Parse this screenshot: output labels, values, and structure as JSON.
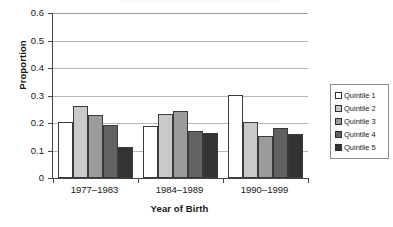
{
  "chart_data": {
    "type": "bar",
    "title": "",
    "xlabel": "Year of Birth",
    "ylabel": "Proportion",
    "categories": [
      "1977–1983",
      "1984–1989",
      "1990–1999"
    ],
    "series": [
      {
        "name": "Quintile 1",
        "color": "#ffffff",
        "values": [
          0.205,
          0.189,
          0.303
        ]
      },
      {
        "name": "Quintile 2",
        "color": "#c9c9c9",
        "values": [
          0.263,
          0.231,
          0.204
        ]
      },
      {
        "name": "Quintile 3",
        "color": "#9b9b9b",
        "values": [
          0.229,
          0.243,
          0.152
        ]
      },
      {
        "name": "Quintile 4",
        "color": "#626262",
        "values": [
          0.194,
          0.171,
          0.182
        ]
      },
      {
        "name": "Quintile 5",
        "color": "#333333",
        "values": [
          0.111,
          0.162,
          0.159
        ]
      }
    ],
    "ylim": [
      0,
      0.6
    ],
    "ytick_labels": [
      "0.6",
      "0.5",
      "0.4",
      "0.3",
      "0.2",
      "0.1",
      "0"
    ],
    "ytick_values": [
      0.6,
      0.5,
      0.4,
      0.3,
      0.2,
      0.1,
      0
    ],
    "grid": "horizontal",
    "legend_position": "right"
  },
  "axes": {
    "y_title": "Proportion",
    "x_title": "Year of Birth",
    "y_ticks": [
      {
        "label": "0.6",
        "value": 0.6
      },
      {
        "label": "0.5",
        "value": 0.5
      },
      {
        "label": "0.4",
        "value": 0.4
      },
      {
        "label": "0.3",
        "value": 0.3
      },
      {
        "label": "0.2",
        "value": 0.2
      },
      {
        "label": "0.1",
        "value": 0.1
      },
      {
        "label": "0",
        "value": 0
      }
    ],
    "x_categories": [
      "1977–1983",
      "1984–1989",
      "1990–1999"
    ]
  },
  "legend": {
    "items": [
      {
        "label": "Quintile 1",
        "color": "#ffffff"
      },
      {
        "label": "Quintile 2",
        "color": "#c9c9c9"
      },
      {
        "label": "Quintile 3",
        "color": "#9b9b9b"
      },
      {
        "label": "Quintile 4",
        "color": "#626262"
      },
      {
        "label": "Quintile 5",
        "color": "#333333"
      }
    ]
  },
  "colors": {
    "axis": "#444444",
    "gridline": "#b9b9b9",
    "text": "#161616",
    "legend_border": "#8e8e8e",
    "bar_outline": "#3a3a3a"
  }
}
